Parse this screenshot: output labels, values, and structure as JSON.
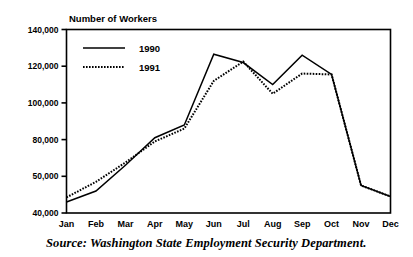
{
  "chart_data": {
    "type": "line",
    "title": "Number of Workers",
    "xlabel": "",
    "ylabel": "",
    "grid": false,
    "legend_position": "top-left-inside",
    "categories": [
      "Jan",
      "Feb",
      "Mar",
      "Apr",
      "May",
      "Jun",
      "Jul",
      "Aug",
      "Sep",
      "Oct",
      "Nov",
      "Dec"
    ],
    "ylim": [
      40000,
      140000
    ],
    "ytick_labels": [
      "140,000",
      "120,000",
      "100,000",
      "80,000",
      "50,000",
      "40,000"
    ],
    "ytick_values": [
      140000,
      120000,
      100000,
      80000,
      60000,
      40000
    ],
    "series": [
      {
        "name": "1990",
        "style": "solid",
        "color": "#000000",
        "values": [
          46000,
          52000,
          66000,
          81000,
          88000,
          126500,
          122000,
          110000,
          126000,
          115500,
          55000,
          49000
        ]
      },
      {
        "name": "1991",
        "style": "dotted",
        "color": "#000000",
        "values": [
          48500,
          57000,
          67500,
          79000,
          86000,
          112000,
          122500,
          105000,
          116000,
          115500,
          55000,
          49000
        ]
      }
    ]
  },
  "caption": {
    "source_text": "Source: Washington State Employment Security Department."
  },
  "legend": {
    "items": [
      {
        "label": "1990",
        "style": "solid"
      },
      {
        "label": "1991",
        "style": "dotted"
      }
    ]
  }
}
